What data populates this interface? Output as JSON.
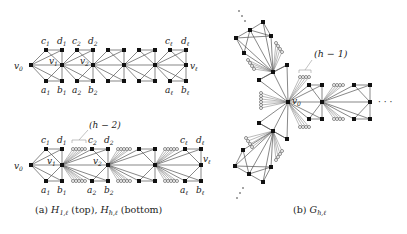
{
  "figure": {
    "panel_a": {
      "caption_prefix": "(a)",
      "caption_g1": "H",
      "caption_g1_sub": "1,ℓ",
      "caption_mid": "(top),",
      "caption_g2": "H",
      "caption_g2_sub": "h,ℓ",
      "caption_end": "(bottom)",
      "top_graph": {
        "name": "H_{1,ℓ}",
        "labels": {
          "v0": "v",
          "v0_sub": "0",
          "v1": "v",
          "v1_sub": "1",
          "v2": "v",
          "v2_sub": "2",
          "vl": "v",
          "vl_sub": "ℓ",
          "c1": "c",
          "c1_sub": "1",
          "d1": "d",
          "d1_sub": "1",
          "c2": "c",
          "c2_sub": "2",
          "d2": "d",
          "d2_sub": "2",
          "cl": "c",
          "cl_sub": "ℓ",
          "dl": "d",
          "dl_sub": "ℓ",
          "a1": "a",
          "a1_sub": "1",
          "b1": "b",
          "b1_sub": "1",
          "a2": "a",
          "a2_sub": "2",
          "b2": "b",
          "b2_sub": "2",
          "al": "a",
          "al_sub": "ℓ",
          "bl": "b",
          "bl_sub": "ℓ"
        }
      },
      "bottom_graph": {
        "name": "H_{h,ℓ}",
        "annotation": "(h − 2)",
        "labels": {
          "v0": "v",
          "v0_sub": "0",
          "v1": "v",
          "v1_sub": "1",
          "v2": "v",
          "v2_sub": "2",
          "vl": "v",
          "vl_sub": "ℓ",
          "c1": "c",
          "c1_sub": "1",
          "d1": "d",
          "d1_sub": "1",
          "c2": "c",
          "c2_sub": "2",
          "d2": "d",
          "d2_sub": "2",
          "cl": "c",
          "cl_sub": "ℓ",
          "dl": "d",
          "dl_sub": "ℓ",
          "a1": "a",
          "a1_sub": "1",
          "b1": "b",
          "b1_sub": "1",
          "a2": "a",
          "a2_sub": "2",
          "b2": "b",
          "b2_sub": "2",
          "al": "a",
          "al_sub": "ℓ",
          "bl": "b",
          "bl_sub": "ℓ"
        }
      }
    },
    "panel_b": {
      "caption_prefix": "(b)",
      "caption_g": "G",
      "caption_g_sub": "h,ℓ",
      "annotation": "(h − 1)",
      "hub_label": "v",
      "hub_label_sub": "0",
      "ellipsis": "· · ·"
    }
  }
}
